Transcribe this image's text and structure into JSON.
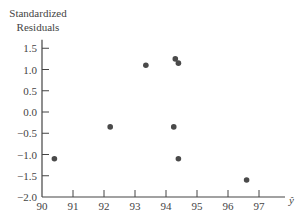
{
  "chart_data": {
    "type": "scatter",
    "title": "",
    "ylabel_line1": "Standardized",
    "ylabel_line2": "Residuals",
    "xlabel": "ŷ",
    "xlim": [
      90,
      97.8
    ],
    "ylim": [
      -2.0,
      1.7
    ],
    "xticks": [
      90,
      91,
      92,
      93,
      94,
      95,
      96,
      97
    ],
    "yticks": [
      1.5,
      1.0,
      0.5,
      0.0,
      -0.5,
      -1.0,
      -1.5,
      -2.0
    ],
    "ytick_labels": [
      "1.5",
      "1.0",
      "0.5",
      "0.0",
      "−0.5",
      "−1.0",
      "−1.5",
      "−2.0"
    ],
    "grid": false,
    "point_color": "#4a4a4a",
    "points": [
      {
        "x": 90.4,
        "y": -1.1
      },
      {
        "x": 92.2,
        "y": -0.35
      },
      {
        "x": 93.35,
        "y": 1.1
      },
      {
        "x": 94.3,
        "y": 1.25
      },
      {
        "x": 94.4,
        "y": 1.15
      },
      {
        "x": 94.25,
        "y": -0.35
      },
      {
        "x": 94.4,
        "y": -1.1
      },
      {
        "x": 96.6,
        "y": -1.6
      }
    ]
  }
}
